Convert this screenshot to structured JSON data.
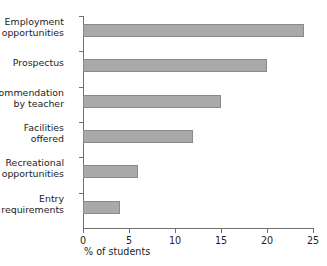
{
  "chart_data": {
    "type": "bar",
    "orientation": "horizontal",
    "title": "",
    "xlabel": "% of students",
    "ylabel": "",
    "xlim": [
      0,
      25
    ],
    "xticks": [
      0,
      5,
      10,
      15,
      20,
      25
    ],
    "grid": false,
    "legend": null,
    "categories": [
      "Employment\nopportunities",
      "Prospectus",
      "Recommendation\nby teacher",
      "Facilities\noffered",
      "Recreational\nopportunities",
      "Entry\nrequirements"
    ],
    "values": [
      24,
      20,
      15,
      12,
      6,
      4
    ],
    "bar_color": "#a9a9a9",
    "bar_edge_color": "#8a8a8a",
    "axis_color": "#6f6f6f"
  }
}
